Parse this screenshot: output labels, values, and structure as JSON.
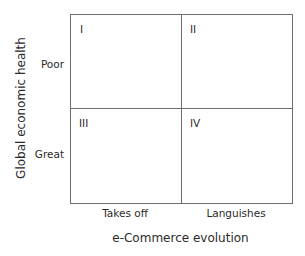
{
  "diagram": {
    "type": "2x2 matrix",
    "x_axis": {
      "title": "e-Commerce evolution",
      "categories": [
        "Takes off",
        "Languishes"
      ]
    },
    "y_axis": {
      "title": "Global economic health",
      "categories": [
        "Poor",
        "Great"
      ]
    },
    "quadrants": [
      {
        "label": "I"
      },
      {
        "label": "II"
      },
      {
        "label": "III"
      },
      {
        "label": "IV"
      }
    ]
  }
}
